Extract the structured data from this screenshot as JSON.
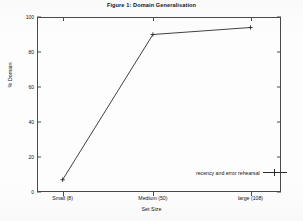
{
  "chart_data": {
    "type": "line",
    "title": "Figure 1: Domain Generalisation",
    "xlabel": "Set Size",
    "ylabel": "% Domain",
    "categories": [
      "Small (8)",
      "Medium (50)",
      "large (108)"
    ],
    "x_values": [
      8,
      50,
      108
    ],
    "series": [
      {
        "name": "recency and error rehearsal",
        "values": [
          7,
          90,
          94
        ],
        "marker": "plus",
        "color": "#2b2b2b"
      }
    ],
    "ylim": [
      0,
      100
    ],
    "y_ticks": [
      "0",
      "20",
      "40",
      "60",
      "80",
      "100"
    ],
    "y_tick_values": [
      0,
      20,
      40,
      60,
      80,
      100
    ],
    "grid": false,
    "legend_position": "bottom-right-inside",
    "legend_entries": [
      "recency and error rehearsal"
    ]
  },
  "legend": {
    "entry_label": "recency and error rehearsal"
  }
}
